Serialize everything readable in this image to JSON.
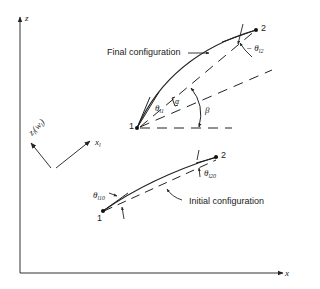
{
  "axes": {
    "vertical_label": "z",
    "horizontal_label": "x"
  },
  "local_frame": {
    "z_label": "z",
    "z_sub": "l",
    "z_paren": "(w",
    "z_paren_sub": "l",
    "z_close": ")",
    "x_label": "x",
    "x_sub": "l"
  },
  "final_configuration": {
    "label": "Final configuration",
    "node1": "1",
    "node2": "2",
    "theta1": "θ",
    "theta1_sub": "l1",
    "theta2_prefix": "− θ",
    "theta2_sub": "l2",
    "alpha": "α",
    "beta": "β"
  },
  "initial_configuration": {
    "label": "Initial configuration",
    "node1": "1",
    "node2": "2",
    "theta10": "θ",
    "theta10_sub": "l10",
    "theta20": "θ",
    "theta20_sub": "l20"
  },
  "colors": {
    "ink": "#222222",
    "background": "#ffffff"
  }
}
